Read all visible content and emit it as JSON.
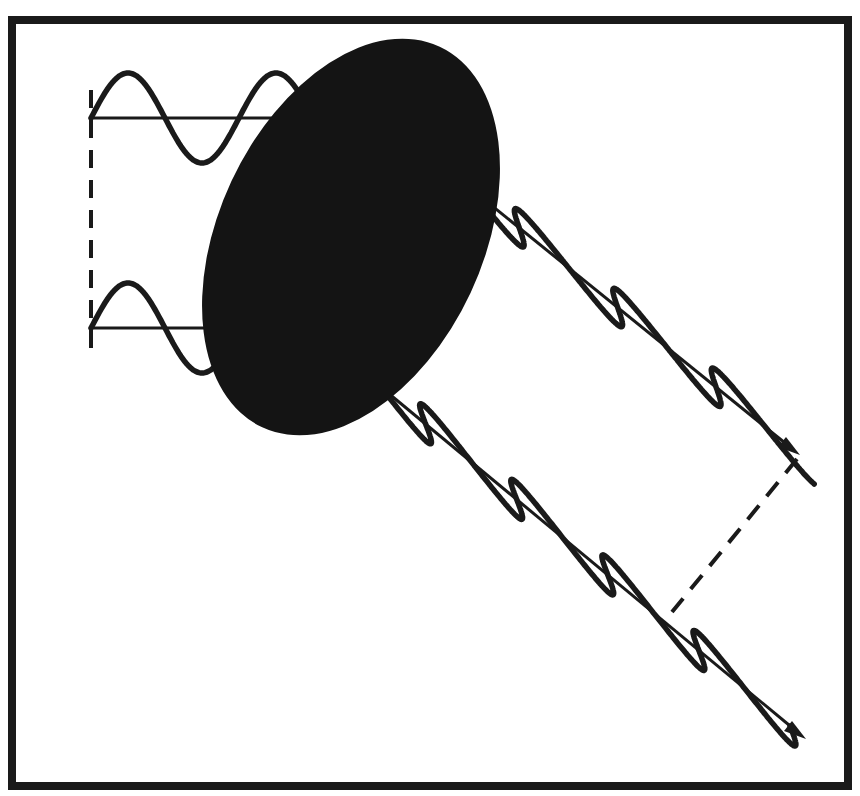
{
  "figure": {
    "colors": {
      "ink": "#1a1a1a",
      "particle": "#141414",
      "background": "#ffffff"
    },
    "elements": {
      "particle": "scattering-particle",
      "incident_waves": [
        "incident-wave-upper",
        "incident-wave-lower"
      ],
      "scattered_waves": [
        "scattered-wave-upper",
        "scattered-wave-lower"
      ],
      "incident_wavefront": "dashed-wavefront-incident",
      "scattered_wavefront": "dashed-wavefront-scattered"
    },
    "incident_wave_cycles": 1.75,
    "scattered_wave_cycles_upper": 3.25,
    "scattered_wave_cycles_lower": 4.5
  }
}
